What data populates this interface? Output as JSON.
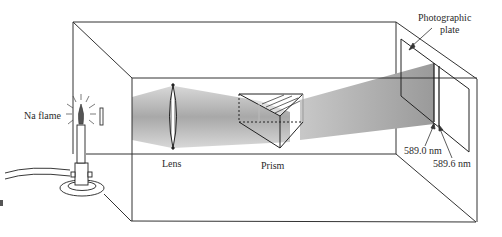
{
  "figure": {
    "colors": {
      "line": "#333333",
      "beam": "#9a9a9a",
      "background": "#ffffff"
    }
  },
  "labels": {
    "source": "Na flame",
    "lens": "Lens",
    "prism": "Prism",
    "plate_line1": "Photographic",
    "plate_line2": "plate",
    "line1": "589.0 nm",
    "line2": "589.6 nm"
  },
  "components": [
    {
      "name": "Na flame",
      "type": "light-source"
    },
    {
      "name": "Slit",
      "type": "aperture"
    },
    {
      "name": "Lens",
      "type": "converging-lens"
    },
    {
      "name": "Prism",
      "type": "triangular-prism"
    },
    {
      "name": "Photographic plate",
      "type": "detector"
    }
  ],
  "spectral_lines_nm": [
    589.0,
    589.6
  ]
}
